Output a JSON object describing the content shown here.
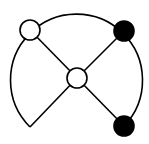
{
  "diagram": {
    "canvas": {
      "width": 149,
      "height": 144,
      "background": "#ffffff"
    },
    "stroke_color": "#000000",
    "stroke_width": 1.6,
    "arc": {
      "center": [
        77,
        77
      ],
      "radius": 66,
      "start_point": [
        30,
        127
      ],
      "end_point": [
        124,
        126
      ],
      "description": "large circular arc from lower-left wedge tip, sweeping over the top, down to lower-right node"
    },
    "center_node": {
      "id": "center",
      "x": 77,
      "y": 78,
      "r": 10,
      "fill": "#ffffff"
    },
    "nodes": [
      {
        "id": "top-left",
        "x": 30,
        "y": 30,
        "r": 10,
        "fill": "#ffffff"
      },
      {
        "id": "top-right",
        "x": 124,
        "y": 31,
        "r": 10,
        "fill": "#000000"
      },
      {
        "id": "bottom-right",
        "x": 124,
        "y": 126,
        "r": 10,
        "fill": "#000000"
      }
    ],
    "edges": [
      {
        "from": "center",
        "to": "top-left",
        "x1": 77,
        "y1": 78,
        "x2": 30,
        "y2": 30
      },
      {
        "from": "center",
        "to": "top-right",
        "x1": 77,
        "y1": 78,
        "x2": 124,
        "y2": 31
      },
      {
        "from": "center",
        "to": "bottom-right",
        "x1": 77,
        "y1": 78,
        "x2": 124,
        "y2": 126
      },
      {
        "from": "center",
        "to": "wedge-tip",
        "x1": 77,
        "y1": 78,
        "x2": 30,
        "y2": 127
      }
    ]
  }
}
